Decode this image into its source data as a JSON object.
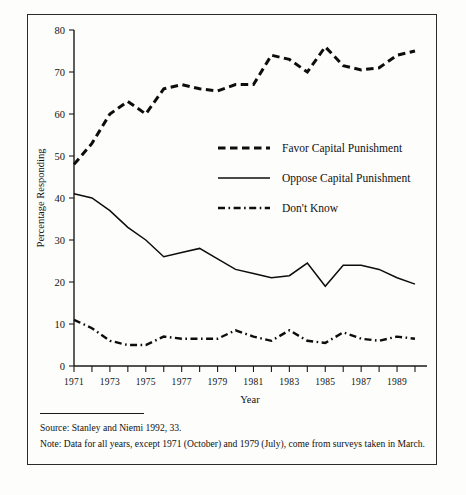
{
  "figure": {
    "source_rule": "",
    "source_text": "Source: Stanley and Niemi 1992, 33.",
    "note_text": "Note: Data for all years, except 1971 (October) and 1979 (July), come from surveys taken in March."
  },
  "chart_data": {
    "type": "line",
    "title": "",
    "xlabel": "Year",
    "ylabel": "Percentage Responding",
    "ylim": [
      0,
      80
    ],
    "xlim": [
      1971,
      1990
    ],
    "grid": false,
    "legend_position": "inside-right-upper",
    "ytick_labels": [
      "0",
      "10",
      "20",
      "30",
      "40",
      "50",
      "60",
      "70",
      "80"
    ],
    "ytick_values": [
      0,
      10,
      20,
      30,
      40,
      50,
      60,
      70,
      80
    ],
    "xtick_values": [
      1971,
      1972,
      1973,
      1974,
      1975,
      1976,
      1977,
      1978,
      1979,
      1980,
      1981,
      1982,
      1983,
      1984,
      1985,
      1986,
      1987,
      1988,
      1989,
      1990
    ],
    "xtick_labels_shown": [
      "1971",
      "1973",
      "1975",
      "1977",
      "1979",
      "1981",
      "1983",
      "1985",
      "1987",
      "1989"
    ],
    "x": [
      1971,
      1972,
      1973,
      1974,
      1975,
      1976,
      1977,
      1978,
      1979,
      1980,
      1981,
      1982,
      1983,
      1984,
      1985,
      1986,
      1987,
      1988,
      1989,
      1990
    ],
    "series": [
      {
        "name": "Favor Capital Punishment",
        "style": "dashed",
        "values": [
          48,
          53,
          60,
          63,
          60,
          66,
          67,
          66,
          65.5,
          67,
          67,
          74,
          73,
          70,
          76,
          71.5,
          70.5,
          71,
          74,
          75
        ]
      },
      {
        "name": "Oppose Capital Punishment",
        "style": "solid",
        "values": [
          41,
          40,
          37,
          33,
          30,
          26,
          27,
          28,
          25.5,
          23,
          22,
          21,
          21.5,
          24.5,
          19,
          24,
          24,
          23,
          21,
          19.5
        ]
      },
      {
        "name": "Don't Know",
        "style": "dash-dot",
        "values": [
          11,
          9,
          6,
          5,
          5,
          7,
          6.5,
          6.5,
          6.5,
          8.5,
          7,
          6,
          8.5,
          6,
          5.5,
          8,
          6.5,
          6,
          7,
          6.5
        ]
      }
    ]
  },
  "legend": {
    "items": [
      {
        "label": "Favor Capital Punishment",
        "style": "dashed"
      },
      {
        "label": "Oppose Capital Punishment",
        "style": "solid"
      },
      {
        "label": "Don't Know",
        "style": "dash-dot"
      }
    ]
  }
}
